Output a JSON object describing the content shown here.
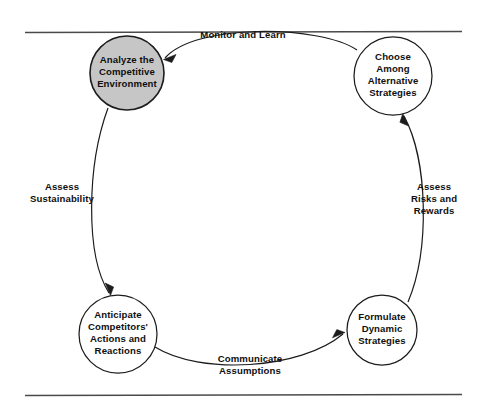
{
  "figure": {
    "type": "cycle-diagram",
    "background_color": "#ffffff",
    "line_color": "#1c1c1c",
    "rule_color": "#4a4a4a",
    "highlight_fill": "#c6c6c6",
    "flow_direction": "counter-clockwise"
  },
  "rules": {
    "top_label": "top-horizontal-rule",
    "bottom_label": "bottom-horizontal-rule"
  },
  "nodes": [
    {
      "id": "analyze",
      "highlighted": true,
      "lines": [
        "Analyze the",
        "Competitive",
        "Environment"
      ],
      "cx": 127,
      "cy": 73,
      "r": 37
    },
    {
      "id": "choose",
      "highlighted": false,
      "lines": [
        "Choose",
        "Among",
        "Alternative",
        "Strategies"
      ],
      "cx": 393,
      "cy": 76,
      "r": 39
    },
    {
      "id": "formulate",
      "highlighted": false,
      "lines": [
        "Formulate",
        "Dynamic",
        "Strategies"
      ],
      "cx": 382,
      "cy": 330,
      "r": 35
    },
    {
      "id": "anticipate",
      "highlighted": false,
      "lines": [
        "Anticipate",
        "Competitors'",
        "Actions and",
        "Reactions"
      ],
      "cx": 118,
      "cy": 334,
      "r": 39
    }
  ],
  "edges": [
    {
      "id": "monitor-and-learn",
      "from": "choose",
      "to": "analyze",
      "lines": [
        "Monitor and Learn"
      ],
      "label_x": 243,
      "label_y": 38
    },
    {
      "id": "assess-sustainability",
      "from": "analyze",
      "to": "anticipate",
      "lines": [
        "Assess",
        "Sustainability"
      ],
      "label_x": 62,
      "label_y": 190
    },
    {
      "id": "communicate-assumptions",
      "from": "anticipate",
      "to": "formulate",
      "lines": [
        "Communicate",
        "Assumptions"
      ],
      "label_x": 250,
      "label_y": 362
    },
    {
      "id": "assess-risks-and-rewards",
      "from": "formulate",
      "to": "choose",
      "lines": [
        "Assess",
        "Risks and",
        "Rewards"
      ],
      "label_x": 434,
      "label_y": 190
    }
  ]
}
